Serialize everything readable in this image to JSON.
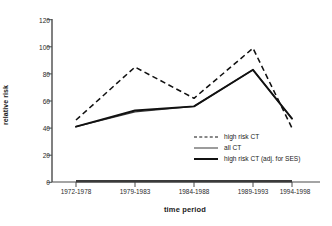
{
  "chart_data": {
    "type": "line",
    "title": "",
    "xlabel": "time period",
    "ylabel": "relative risk",
    "categories": [
      "1972-1978",
      "1979-1983",
      "1984-1988",
      "1989-1993",
      "1994-1998"
    ],
    "ylim": [
      0,
      120
    ],
    "yticks": [
      0,
      20,
      40,
      60,
      80,
      100,
      120
    ],
    "grid": false,
    "legend_position": "inside-lower-right",
    "series": [
      {
        "name": "high risk CT",
        "style": "dashed",
        "color": "#111111",
        "values": [
          46,
          85,
          62,
          99,
          40
        ]
      },
      {
        "name": "all CT",
        "style": "solid-thin",
        "color": "#3a3a3a",
        "values": [
          41,
          52,
          56,
          83,
          47
        ]
      },
      {
        "name": "high risk CT (adj. for SES)",
        "style": "solid-thick",
        "color": "#111111",
        "values": [
          41,
          53,
          56,
          83,
          47
        ]
      }
    ]
  },
  "axes": {
    "y_tick_labels": [
      "120",
      "100",
      "80",
      "60",
      "40",
      "20",
      "0"
    ],
    "x_tick_labels": [
      "1972-1978",
      "1979-1983",
      "1984-1988",
      "1989-1993",
      "1994-1998"
    ],
    "y_axis_title": "relative risk",
    "x_axis_title": "time period"
  },
  "legend": {
    "items": [
      {
        "label": "high risk CT",
        "style": "dashed"
      },
      {
        "label": "all CT",
        "style": "solid-thin"
      },
      {
        "label": "high risk CT (adj. for SES)",
        "style": "solid-thick"
      }
    ]
  }
}
